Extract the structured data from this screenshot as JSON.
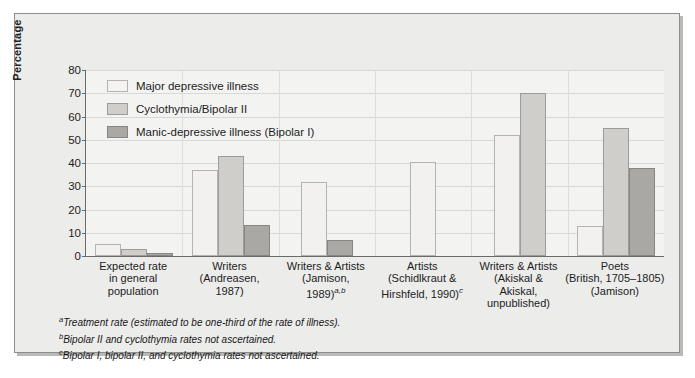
{
  "chart_data": {
    "type": "bar",
    "title": "",
    "xlabel": "",
    "ylabel": "Percentage",
    "ylim": [
      0,
      80
    ],
    "yticks": [
      0,
      10,
      20,
      30,
      40,
      50,
      60,
      70,
      80
    ],
    "grid": true,
    "legend_position": "top-left",
    "legend": [
      "Major depressive illness",
      "Cyclothymia/Bipolar II",
      "Manic-depressive illness (Bipolar I)"
    ],
    "categories": [
      "Expected rate in general population",
      "Writers (Andreasen, 1987)",
      "Writers & Artists (Jamison, 1989)",
      "Artists (Schildkraut & Hirshfeld, 1990)",
      "Writers & Artists (Akiskal & Akiskal, unpublished)",
      "Poets (British, 1705–1805) (Jamison)"
    ],
    "series": [
      {
        "name": "Major depressive illness",
        "values": [
          5,
          37,
          32,
          40.5,
          52,
          13
        ]
      },
      {
        "name": "Cyclothymia/Bipolar II",
        "values": [
          3,
          43,
          null,
          null,
          70,
          55
        ]
      },
      {
        "name": "Manic-depressive illness (Bipolar I)",
        "values": [
          1.5,
          13.5,
          7,
          null,
          null,
          38
        ]
      }
    ]
  },
  "axis": {
    "y_title": "Percentage",
    "y_ticks": [
      "0",
      "10",
      "20",
      "30",
      "40",
      "50",
      "60",
      "70",
      "80"
    ]
  },
  "legend": {
    "items": [
      {
        "label": "Major depressive illness",
        "swatch": "series-0-swatch"
      },
      {
        "label": "Cyclothymia/Bipolar II",
        "swatch": "series-1-swatch"
      },
      {
        "label": "Manic-depressive illness (Bipolar I)",
        "swatch": "series-2-swatch"
      }
    ]
  },
  "categories": [
    {
      "lines": [
        "Expected rate",
        "in general",
        "population"
      ],
      "marker": ""
    },
    {
      "lines": [
        "Writers",
        "(Andreasen,",
        "1987)"
      ],
      "marker": ""
    },
    {
      "lines": [
        "Writers & Artists",
        "(Jamison,",
        "1989)"
      ],
      "marker": "a,b"
    },
    {
      "lines": [
        "Artists",
        "(Schidlkraut &",
        "Hirshfeld, 1990)"
      ],
      "marker": "c"
    },
    {
      "lines": [
        "Writers & Artists",
        "(Akiskal &",
        "Akiskal,",
        "unpublished)"
      ],
      "marker": ""
    },
    {
      "lines": [
        "Poets",
        "(British, 1705–1805)",
        "(Jamison)"
      ],
      "marker": ""
    }
  ],
  "footnotes": [
    {
      "marker": "a",
      "text": "Treatment rate (estimated to be one-third of the rate of illness)."
    },
    {
      "marker": "b",
      "text": "Bipolar II and cyclothymia rates not ascertained."
    },
    {
      "marker": "c",
      "text": "Bipolar I, bipolar II, and cyclothymia rates not ascertained."
    }
  ],
  "colors": {
    "series_0": "#f2f1ef",
    "series_1": "#cfcecb",
    "series_2": "#a9a8a5",
    "plot_bg": "#f3f3f2",
    "frame_bg": "#ececeb",
    "axis": "#6a6a69"
  }
}
